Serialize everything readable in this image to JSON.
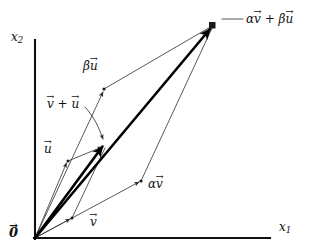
{
  "figure": {
    "background_color": "#ffffff",
    "ink_color": "#111111",
    "thin_stroke_color": "#3a3a3a",
    "bold_stroke_color": "#000000"
  },
  "axes": {
    "x_axis_label": "x",
    "x_axis_subscript": "1",
    "y_axis_label": "x",
    "y_axis_subscript": "2",
    "origin_label": "0",
    "origin_x": 35,
    "origin_y": 238,
    "x_axis_end_x": 270,
    "y_axis_top_y": 40
  },
  "labels": {
    "origin": "0",
    "vector_v": "v",
    "vector_u": "u",
    "vector_sum": "v + u",
    "alpha_v": "αv",
    "beta_u": "βu",
    "apex": "αv + βu",
    "apex_arrow": "←"
  },
  "chart_data": {
    "type": "scatter",
    "xlabel": "x1",
    "ylabel": "x2",
    "grid": false,
    "legend": null,
    "points": [
      {
        "name": "origin",
        "label": "0",
        "x": 35,
        "y": 238
      },
      {
        "name": "v_tip",
        "label": "v",
        "x": 72,
        "y": 218
      },
      {
        "name": "u_tip",
        "label": "u",
        "x": 68,
        "y": 161
      },
      {
        "name": "v_plus_u",
        "label": "v + u",
        "x": 105,
        "y": 148
      },
      {
        "name": "alpha_v_tip",
        "label": "αv",
        "x": 141,
        "y": 181
      },
      {
        "name": "beta_u_tip",
        "label": "βu",
        "x": 104,
        "y": 89
      },
      {
        "name": "apex",
        "label": "αv + βu",
        "x": 213,
        "y": 25
      }
    ],
    "segments": [
      {
        "name": "v_arrow",
        "from": "origin",
        "to": "v_tip",
        "weight": "thin",
        "arrow": true
      },
      {
        "name": "u_arrow",
        "from": "origin",
        "to": "u_tip",
        "weight": "thin",
        "arrow": true
      },
      {
        "name": "sum_arrow",
        "from": "origin",
        "to": "v_plus_u",
        "weight": "bold",
        "arrow": true
      },
      {
        "name": "u_to_sum",
        "from": "u_tip",
        "to": "v_plus_u",
        "weight": "thin",
        "arrow": true
      },
      {
        "name": "v_to_sum",
        "from": "v_tip",
        "to": "v_plus_u",
        "weight": "thin",
        "arrow": false
      },
      {
        "name": "alpha_v_arrow",
        "from": "origin",
        "to": "alpha_v_tip",
        "weight": "thin",
        "arrow": true
      },
      {
        "name": "beta_u_arrow",
        "from": "origin",
        "to": "beta_u_tip",
        "weight": "thin",
        "arrow": true
      },
      {
        "name": "alpha_v_to_apex",
        "from": "alpha_v_tip",
        "to": "apex",
        "weight": "thin",
        "arrow": false
      },
      {
        "name": "beta_u_to_apex",
        "from": "beta_u_tip",
        "to": "apex",
        "weight": "thin",
        "arrow": false
      },
      {
        "name": "combination_arrow",
        "from": "origin",
        "to": "apex",
        "weight": "bold",
        "arrow": true
      }
    ]
  }
}
